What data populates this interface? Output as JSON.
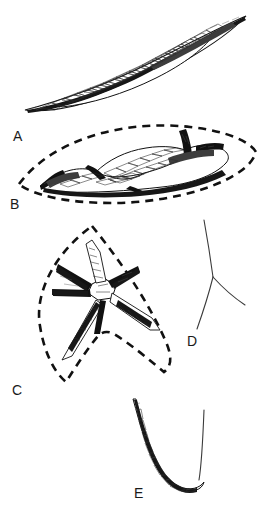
{
  "figure": {
    "type": "scientific-line-illustration-plate",
    "medium": "black ink line drawing on white background",
    "background_color": "#ffffff",
    "ink_color": "#111111",
    "panel_count": 5
  },
  "panels": [
    {
      "id": "A",
      "label": "A",
      "label_x": 13,
      "label_y": 129,
      "shape": "elongated fusiform spindle (oxea-like), pointed at both ends, inclined from lower-left to upper-right",
      "has_dashed_outline": false,
      "texture": "polygonal cobblestone / reticulate internal cells with dark shading along lower margin",
      "bbox": [
        22,
        14,
        250,
        114
      ]
    },
    {
      "id": "B",
      "label": "B",
      "label_x": 10,
      "label_y": 197,
      "shape": "horizontally elongated spiny body with lateral projections, enclosed in a dashed lens (pointed-oval) outline",
      "has_dashed_outline": true,
      "dashed_outline_shape": "lens / pointed ellipse",
      "texture": "polygonal cobblestone plates with heavy black shading on ventral margin and spines",
      "bbox": [
        18,
        128,
        257,
        205
      ]
    },
    {
      "id": "C",
      "label": "C",
      "label_x": 12,
      "label_y": 383,
      "shape": "radiate star-shaped body with six to seven tapering arms, enclosed in a dashed arrowhead (notched shield) outline",
      "has_dashed_outline": true,
      "dashed_outline_shape": "arrowhead / notched shield",
      "texture": "hatched and stippled tapering rays radiating from a central node",
      "bbox": [
        34,
        224,
        172,
        390
      ]
    },
    {
      "id": "D",
      "label": "D",
      "label_x": 187,
      "label_y": 334,
      "shape": "thin triradiate (Y-shaped) line, three slender curved rays meeting at a junction",
      "has_dashed_outline": false,
      "texture": "plain fine outline, no internal shading",
      "bbox": [
        195,
        219,
        246,
        330
      ]
    },
    {
      "id": "E",
      "label": "E",
      "label_x": 134,
      "label_y": 486,
      "shape": "deep U / J-shaped hook (sigma-like), thick textured outer limb and slender inner limb",
      "has_dashed_outline": false,
      "texture": "elongate polygonal cells along the shaft with dark outer margin",
      "bbox": [
        128,
        398,
        205,
        500
      ]
    }
  ]
}
